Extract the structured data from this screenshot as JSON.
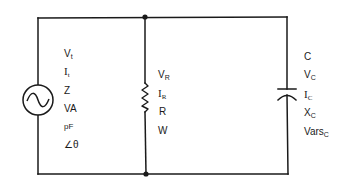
{
  "diagram": {
    "type": "parallel RC circuit",
    "source": {
      "symbol": "ac-source",
      "labels": [
        {
          "main": "V",
          "sub": "t"
        },
        {
          "main": "I",
          "sub": "t"
        },
        {
          "main": "Z",
          "sub": ""
        },
        {
          "main": "VA",
          "sub": ""
        },
        {
          "main": "pF",
          "sub": ""
        },
        {
          "main": "∠θ",
          "sub": ""
        }
      ]
    },
    "resistor": {
      "symbol": "resistor",
      "labels": [
        {
          "main": "V",
          "sub": "R"
        },
        {
          "main": "I",
          "sub": "R"
        },
        {
          "main": "R",
          "sub": ""
        },
        {
          "main": "W",
          "sub": ""
        }
      ]
    },
    "capacitor": {
      "symbol": "capacitor",
      "labels": [
        {
          "main": "C",
          "sub": ""
        },
        {
          "main": "V",
          "sub": "C"
        },
        {
          "main": "I",
          "sub": "C"
        },
        {
          "main": "X",
          "sub": "C"
        },
        {
          "main": "Vars",
          "sub": "C"
        }
      ]
    },
    "colors": {
      "wire": "#1a1a1a",
      "background": "#ffffff"
    }
  }
}
